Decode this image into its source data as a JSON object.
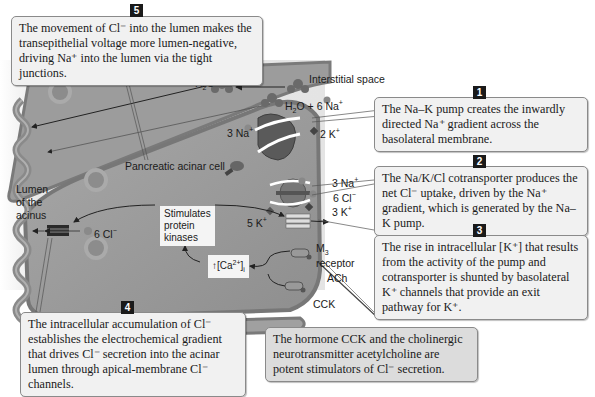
{
  "diagram": {
    "colors": {
      "interstitial": "#e6e6e6",
      "cell": "#9a9a9a",
      "membrane": "#7b7b7b",
      "lumen": "#ffffff",
      "badge": "#1a1a1a",
      "callout_bg": "#f1f1f1",
      "callout_gray_bg": "#dcdcdc"
    },
    "labels": {
      "interstitial_space": "Interstitial space",
      "cell": "Pancreatic acinar cell",
      "lumen_line1": "Lumen",
      "lumen_line2": "of the",
      "lumen_line3": "acinus",
      "h2o_top": "H",
      "h2o_sub": "2",
      "h2o_o": "O",
      "h2o_6na": "+ 6 Na",
      "na3_pump": "3 Na",
      "k2_pump": "2 K",
      "atp": "ATP",
      "na3_co": "3 Na",
      "cl6_co": "6 Cl",
      "k3_co": "3 K",
      "k5": "5 K",
      "cl6_apical": "6 Cl",
      "m3": "M",
      "m3_sub": "3",
      "receptor": "receptor",
      "ach": "ACh",
      "cck": "CCK",
      "stimulates_line1": "Stimulates",
      "stimulates_line2": "protein",
      "stimulates_line3": "kinases",
      "ca_prefix": "↑[Ca",
      "ca_sup": "2+",
      "ca_suffix": "]",
      "ca_sub": "i",
      "plus": "+",
      "minus": "−"
    },
    "callouts": [
      {
        "number": "5",
        "text": "The movement of Cl⁻ into the lumen makes the transepithelial voltage more lumen-negative, driving Na⁺ into the lumen via the tight junctions."
      },
      {
        "number": "1",
        "text": "The Na–K pump creates the inwardly directed Na⁺ gradient across the basolateral membrane."
      },
      {
        "number": "2",
        "text": "The Na/K/Cl cotransporter produces the net Cl⁻ uptake, driven by the Na⁺ gradient, which is generated by the Na–K pump."
      },
      {
        "number": "3",
        "text": "The rise in intracellular [K⁺] that results from the activity of the pump and cotransporter is shunted by basolateral K⁺ channels that provide an exit pathway for K⁺."
      },
      {
        "number": "4",
        "text": "The intracellular accumulation of Cl⁻ establishes the electrochemical gradient that drives Cl⁻ secretion into the acinar lumen through apical-membrane Cl⁻ channels."
      },
      {
        "number": "",
        "text": "The hormone CCK and the cholinergic neurotransmitter acetylcholine are potent stimulators of Cl⁻ secretion."
      }
    ]
  }
}
